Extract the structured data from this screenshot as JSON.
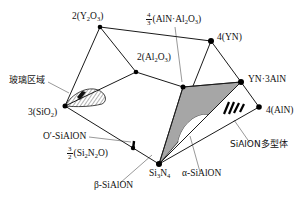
{
  "diagram": {
    "colors": {
      "line": "#1a1a1a",
      "node": "#000000",
      "alpha_sialon_region_fill": "#a6a6a6",
      "background": "#ffffff"
    },
    "nodes": [
      {
        "id": "Y2O3",
        "label_prefix": "2(Y",
        "label_sub1": "2",
        "label_mid": "O",
        "label_sub2": "3",
        "label_suffix": ")",
        "x": 100,
        "y": 27
      },
      {
        "id": "YN",
        "label": "4(YN)",
        "x": 211,
        "y": 41
      },
      {
        "id": "Al2O3",
        "label_prefix": "2(Al",
        "label_sub1": "2",
        "label_mid": "O",
        "label_sub2": "3",
        "label_suffix": ")",
        "x": 136,
        "y": 72
      },
      {
        "id": "AlN_Al2O3",
        "frac_num": "4",
        "frac_den": "3",
        "label_prefix": "(AlN·Al",
        "label_sub1": "2",
        "label_mid": "O",
        "label_sub2": "3",
        "label_suffix": ")",
        "x": 183,
        "y": 87
      },
      {
        "id": "YN_3AlN",
        "label": "YN·3AlN",
        "x": 241,
        "y": 82
      },
      {
        "id": "AlN",
        "label": "4(AlN)",
        "x": 259,
        "y": 107
      },
      {
        "id": "SiO2",
        "label_prefix": "3(SiO",
        "label_sub1": "2",
        "label_suffix": ")",
        "x": 65,
        "y": 106
      },
      {
        "id": "Si3N4",
        "label_prefix": "Si",
        "label_sub1": "3",
        "label_mid": "N",
        "label_sub2": "4",
        "x": 159,
        "y": 164
      },
      {
        "id": "Si2N2O",
        "frac_num": "3",
        "frac_den": "2",
        "label_prefix": "(Si",
        "label_sub1": "2",
        "label_mid": "N",
        "label_sub2": "2",
        "label_suffix": "O)",
        "x": 133,
        "y": 148
      }
    ],
    "region_labels": {
      "glass": "玻璃区域",
      "o_prime_sialon": "O′-SiAlON",
      "beta_sialon": "β-SiAlON",
      "alpha_sialon": "α-SiAlON",
      "polytypes": "SiAlON多型体"
    }
  }
}
